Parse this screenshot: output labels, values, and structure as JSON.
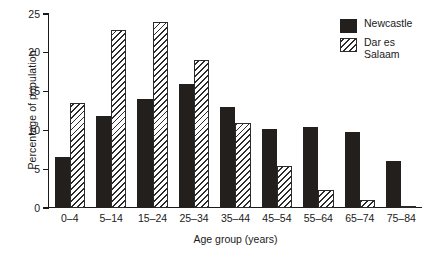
{
  "chart_data": {
    "type": "bar",
    "title": "",
    "xlabel": "Age group (years)",
    "ylabel": "Percentage of population",
    "categories": [
      "0–4",
      "5–14",
      "15–24",
      "25–34",
      "35–44",
      "45–54",
      "55–64",
      "65–74",
      "75–84"
    ],
    "series": [
      {
        "name": "Newcastle",
        "style": "solid-black",
        "color": "#231f1c",
        "values": [
          6.6,
          11.8,
          14.1,
          16.0,
          13.0,
          10.2,
          10.5,
          9.8,
          6.1
        ]
      },
      {
        "name": "Dar es Salaam",
        "style": "diagonal-hatch",
        "color": "#2b2b2b",
        "values": [
          13.5,
          23.0,
          24.0,
          19.1,
          10.9,
          5.4,
          2.3,
          1.0,
          0.3
        ]
      }
    ],
    "ylim": [
      0,
      25
    ],
    "yticks": [
      0,
      5,
      10,
      15,
      20,
      25
    ],
    "ytick_labels": [
      "0",
      "5",
      "10",
      "15",
      "20",
      "25"
    ],
    "grid": false,
    "legend_position": "top-right",
    "legend_entries": [
      "Newcastle",
      "Dar es\nSalaam"
    ]
  },
  "axes": {
    "y_title": "Percentage of population",
    "x_title": "Age group (years)"
  },
  "caption": {
    "text": ""
  }
}
